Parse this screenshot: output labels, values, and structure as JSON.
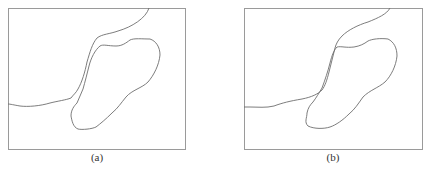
{
  "figure": {
    "panels": [
      {
        "id": "a",
        "label": "(a)",
        "description": "Two contours: boundary curve and closed blob region, separated by a thin gap",
        "frame": {
          "x": 8,
          "y": 8,
          "width": 177,
          "height": 141
        }
      },
      {
        "id": "b",
        "label": "(b)",
        "description": "Two contours: boundary curve and closed blob region touching/intersecting",
        "frame": {
          "x": 244,
          "y": 8,
          "width": 178,
          "height": 141
        }
      }
    ],
    "colors": {
      "frame": "#9a9a9a",
      "curve": "#6e6e6e",
      "label": "#333333",
      "background": "#ffffff"
    },
    "caption_visible": ""
  }
}
